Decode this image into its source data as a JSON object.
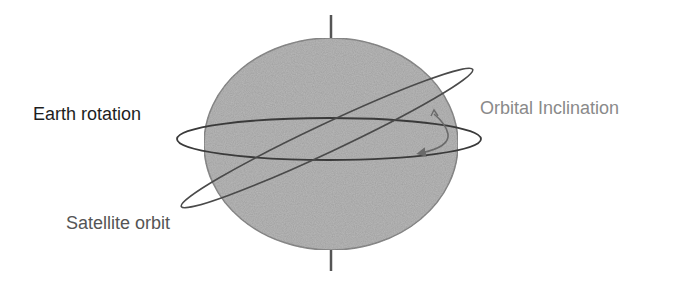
{
  "diagram": {
    "type": "orbital-inclination-illustration",
    "labels": {
      "earth_rotation": "Earth rotation",
      "orbital_inclination": "Orbital Inclination",
      "satellite_orbit": "Satellite orbit"
    },
    "colors": {
      "background": "#ffffff",
      "globe_fill": "#b9b9b9",
      "globe_stroke": "#8f8f8f",
      "axis": "#555555",
      "equator_ring": "#3a3a3a",
      "orbit_ring": "#4a4a4a",
      "inclination_arrow": "#6a6a6a",
      "earth_label": "#1e1e1e",
      "orbital_label": "#8a8a8a",
      "satellite_label": "#555555"
    },
    "elements": [
      {
        "name": "globe",
        "shape": "ellipse"
      },
      {
        "name": "rotation-axis",
        "shape": "line"
      },
      {
        "name": "equatorial-plane",
        "shape": "ellipse"
      },
      {
        "name": "satellite-orbit",
        "shape": "tilted-ellipse",
        "tilt_deg": -25
      },
      {
        "name": "inclination-angle-arrow",
        "shape": "curved-arrow"
      }
    ]
  }
}
